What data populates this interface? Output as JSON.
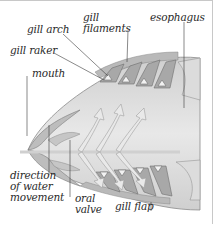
{
  "diagram": {
    "labels": {
      "gill_arch": "gill arch",
      "gill_filaments_line1": "gill",
      "gill_filaments_line2": "filaments",
      "esophagus": "esophagus",
      "gill_raker": "gill raker",
      "mouth": "mouth",
      "direction_line1": "direction",
      "direction_line2": "of water",
      "direction_line3": "movement",
      "oral_valve_line1": "oral",
      "oral_valve_line2": "valve",
      "gill_flap": "gill flap"
    },
    "colors": {
      "body_fill": "#d9d9d9",
      "inner_fill": "#ececec",
      "dark_tissue": "#9a9a9a",
      "gill_red_hint": "#b8a6a6",
      "arrow_fill": "#e6e6e6",
      "leader_line": "#3a3a3a",
      "frame": "#c8c8c8"
    }
  }
}
